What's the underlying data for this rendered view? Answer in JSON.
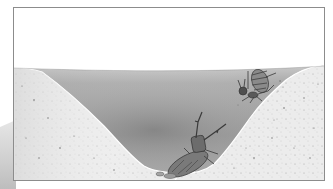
{
  "illustration": {
    "subject": "antlion pit trap with ant sliding in",
    "elements": {
      "sky": {
        "color": "#ffffff"
      },
      "sand": {
        "color": "#e9e9e9",
        "speckle_color": "#7a7a7a"
      },
      "pit_interior": {
        "rim_color": "#c4c4c4",
        "center_color": "#8a8a8a"
      },
      "ant": {
        "position": "upper right slope",
        "color": "#5c5c5c"
      },
      "antlion": {
        "position": "bottom of pit",
        "color": "#6a6a6a"
      }
    },
    "colors": {
      "frame_border": "#8c8c8c",
      "background": "#ffffff"
    }
  }
}
